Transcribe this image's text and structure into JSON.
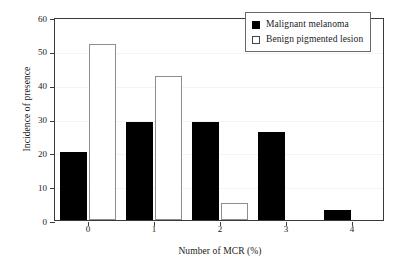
{
  "chart_data": {
    "type": "bar",
    "title": "",
    "xlabel": "Number of MCR (%)",
    "ylabel": "Incidence of presence",
    "categories": [
      "0",
      "1",
      "2",
      "3",
      "4"
    ],
    "series": [
      {
        "name": "Malignant melanoma",
        "color": "#000000",
        "style": "filled",
        "values": [
          20,
          29,
          29,
          26,
          3
        ]
      },
      {
        "name": "Benign pigmented lesion",
        "color": "#ffffff",
        "style": "outlined",
        "values": [
          52,
          42.5,
          5,
          0,
          0
        ]
      }
    ],
    "ylim": [
      0,
      60
    ],
    "yticks": [
      "0",
      "10",
      "20",
      "30",
      "40",
      "50",
      "60"
    ],
    "ytick_values": [
      0,
      10,
      20,
      30,
      40,
      50,
      60
    ],
    "grid": true,
    "legend_position": "top-right"
  },
  "legend": {
    "entries": [
      {
        "label": "Malignant melanoma",
        "swatch": "filled-square"
      },
      {
        "label": "Benign pigmented lesion",
        "swatch": "outlined-square"
      }
    ]
  }
}
